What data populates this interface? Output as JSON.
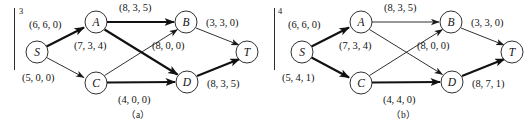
{
  "figure": {
    "type": "network-flow-diagram-pair",
    "panels": [
      {
        "id": "a",
        "index_mark": "3",
        "caption": "（a）",
        "nodes": [
          {
            "id": "S",
            "label": "S",
            "cx": 37,
            "cy": 52
          },
          {
            "id": "A",
            "label": "A",
            "cx": 96,
            "cy": 22
          },
          {
            "id": "C",
            "label": "C",
            "cx": 96,
            "cy": 83
          },
          {
            "id": "B",
            "label": "B",
            "cx": 186,
            "cy": 22
          },
          {
            "id": "D",
            "label": "D",
            "cx": 187,
            "cy": 82
          },
          {
            "id": "T",
            "label": "T",
            "cx": 247,
            "cy": 52
          }
        ],
        "edges": [
          {
            "from": "S",
            "to": "A",
            "label": "(6, 6, 0)",
            "capacity": 6,
            "flow": 6,
            "cost": 0,
            "bold": true,
            "label_x": 29,
            "label_y": 19
          },
          {
            "from": "S",
            "to": "C",
            "label": "(5, 0, 0)",
            "capacity": 5,
            "flow": 0,
            "cost": 0,
            "bold": false,
            "label_x": 22,
            "label_y": 72
          },
          {
            "from": "A",
            "to": "B",
            "label": "(8, 3, 5)",
            "capacity": 8,
            "flow": 3,
            "cost": 5,
            "bold": true,
            "label_x": 119,
            "label_y": 3
          },
          {
            "from": "A",
            "to": "D",
            "label": "(7, 3, 4)",
            "capacity": 7,
            "flow": 3,
            "cost": 4,
            "bold": true,
            "label_x": 75,
            "label_y": 40
          },
          {
            "from": "C",
            "to": "B",
            "label": "(8, 0, 0)",
            "capacity": 8,
            "flow": 0,
            "cost": 0,
            "bold": false,
            "label_x": 152,
            "label_y": 40
          },
          {
            "from": "C",
            "to": "D",
            "label": "(4, 0, 0)",
            "capacity": 4,
            "flow": 0,
            "cost": 0,
            "bold": true,
            "label_x": 118,
            "label_y": 95
          },
          {
            "from": "B",
            "to": "T",
            "label": "(3, 3, 0)",
            "capacity": 3,
            "flow": 3,
            "cost": 0,
            "bold": false,
            "label_x": 206,
            "label_y": 18
          },
          {
            "from": "D",
            "to": "T",
            "label": "(8, 3, 5)",
            "capacity": 8,
            "flow": 3,
            "cost": 5,
            "bold": false,
            "label_x": 208,
            "label_y": 78
          }
        ]
      },
      {
        "id": "b",
        "index_mark": "4",
        "caption": "（b）",
        "nodes": [
          {
            "id": "S",
            "label": "S",
            "cx": 37,
            "cy": 52
          },
          {
            "id": "A",
            "label": "A",
            "cx": 96,
            "cy": 22
          },
          {
            "id": "C",
            "label": "C",
            "cx": 96,
            "cy": 83
          },
          {
            "id": "B",
            "label": "B",
            "cx": 186,
            "cy": 22
          },
          {
            "id": "D",
            "label": "D",
            "cx": 187,
            "cy": 82
          },
          {
            "id": "T",
            "label": "T",
            "cx": 247,
            "cy": 52
          }
        ],
        "edges": [
          {
            "from": "S",
            "to": "A",
            "label": "(6, 6, 0)",
            "capacity": 6,
            "flow": 6,
            "cost": 0,
            "bold": true,
            "label_x": 23,
            "label_y": 19
          },
          {
            "from": "S",
            "to": "C",
            "label": "(5, 4, 1)",
            "capacity": 5,
            "flow": 4,
            "cost": 1,
            "bold": true,
            "label_x": 17,
            "label_y": 72
          },
          {
            "from": "A",
            "to": "B",
            "label": "(8, 3, 5)",
            "capacity": 8,
            "flow": 3,
            "cost": 5,
            "bold": false,
            "label_x": 119,
            "label_y": 3
          },
          {
            "from": "A",
            "to": "D",
            "label": "(7, 3, 4)",
            "capacity": 7,
            "flow": 3,
            "cost": 4,
            "bold": false,
            "label_x": 75,
            "label_y": 40
          },
          {
            "from": "C",
            "to": "B",
            "label": "(8, 0, 0)",
            "capacity": 8,
            "flow": 0,
            "cost": 0,
            "bold": false,
            "label_x": 152,
            "label_y": 40
          },
          {
            "from": "C",
            "to": "D",
            "label": "(4, 4, 0)",
            "capacity": 4,
            "flow": 4,
            "cost": 0,
            "bold": true,
            "label_x": 118,
            "label_y": 95
          },
          {
            "from": "B",
            "to": "T",
            "label": "(3, 3, 0)",
            "capacity": 3,
            "flow": 3,
            "cost": 0,
            "bold": false,
            "label_x": 206,
            "label_y": 18
          },
          {
            "from": "D",
            "to": "T",
            "label": "(8, 7, 1)",
            "capacity": 8,
            "flow": 7,
            "cost": 1,
            "bold": true,
            "label_x": 208,
            "label_y": 78
          }
        ]
      }
    ]
  },
  "panel_a": {
    "index_mark": "3",
    "caption": "（a）",
    "node_S": "S",
    "node_A": "A",
    "node_B": "B",
    "node_C": "C",
    "node_D": "D",
    "node_T": "T",
    "e_SA": "(6, 6, 0)",
    "e_SC": "(5, 0, 0)",
    "e_AB": "(8, 3, 5)",
    "e_AD": "(7, 3, 4)",
    "e_CB": "(8, 0, 0)",
    "e_CD": "(4, 0, 0)",
    "e_BT": "(3, 3, 0)",
    "e_DT": "(8, 3, 5)"
  },
  "panel_b": {
    "index_mark": "4",
    "caption": "（b）",
    "node_S": "S",
    "node_A": "A",
    "node_B": "B",
    "node_C": "C",
    "node_D": "D",
    "node_T": "T",
    "e_SA": "(6, 6, 0)",
    "e_SC": "(5, 4, 1)",
    "e_AB": "(8, 3, 5)",
    "e_AD": "(7, 3, 4)",
    "e_CB": "(8, 0, 0)",
    "e_CD": "(4, 4, 0)",
    "e_BT": "(3, 3, 0)",
    "e_DT": "(8, 7, 1)"
  },
  "colors": {
    "stroke": "#1a1a1a",
    "text": "#141414",
    "background": "#ffffff"
  }
}
